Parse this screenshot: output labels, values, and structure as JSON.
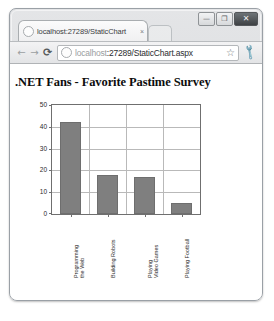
{
  "window": {
    "controls": [
      {
        "name": "minimize",
        "glyph": "—"
      },
      {
        "name": "maximize",
        "glyph": "❐"
      },
      {
        "name": "close",
        "glyph": "✕"
      }
    ]
  },
  "tab": {
    "title": "localhost:27289/StaticChart",
    "close_glyph": "×",
    "favicon": "globe-icon"
  },
  "toolbar": {
    "back_glyph": "←",
    "forward_glyph": "→",
    "reload_glyph": "⟳",
    "url_host": "localhost",
    "url_path": ":27289/StaticChart.aspx",
    "url_full": "localhost:27289/StaticChart.aspx",
    "star_glyph": "☆",
    "wrench_glyph": "🔧",
    "favicon": "globe-icon"
  },
  "page": {
    "title": ".NET Fans - Favorite Pastime Survey"
  },
  "chart_data": {
    "type": "bar",
    "title": ".NET Fans - Favorite Pastime Survey",
    "xlabel": "",
    "ylabel": "",
    "ylim": [
      0,
      50
    ],
    "yticks": [
      0,
      10,
      20,
      30,
      40,
      50
    ],
    "grid": true,
    "legend": null,
    "bar_color": "#7f7f7f",
    "categories": [
      "Programming the Web",
      "Building Robots",
      "Playing Video Games",
      "Playing Football"
    ],
    "category_lines": [
      [
        "Programming",
        "the Web"
      ],
      [
        "Building Robots",
        ""
      ],
      [
        "Playing",
        "Video Games"
      ],
      [
        "Playing Football",
        ""
      ]
    ],
    "values": [
      42,
      18,
      17,
      5
    ]
  }
}
